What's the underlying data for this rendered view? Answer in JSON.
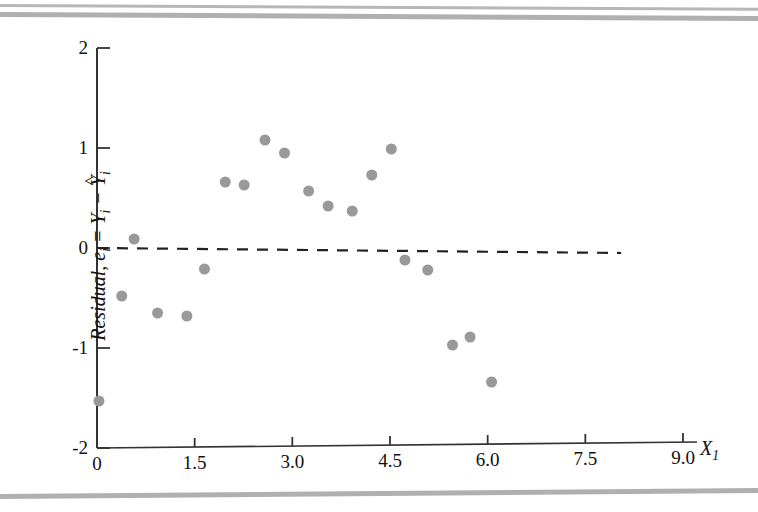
{
  "chart_data": {
    "type": "scatter",
    "title": "",
    "xlabel": "X1",
    "ylabel": "Residual, e_i = Y_i - Y-hat_i",
    "xlim": [
      0,
      9.0
    ],
    "ylim": [
      -2,
      2
    ],
    "xticks": [
      "0",
      "1.5",
      "3.0",
      "4.5",
      "6.0",
      "7.5",
      "9.0"
    ],
    "xtick_values": [
      0,
      1.5,
      3.0,
      4.5,
      6.0,
      7.5,
      9.0
    ],
    "yticks": [
      "2",
      "1",
      "0",
      "-1",
      "-2"
    ],
    "ytick_values": [
      2,
      1,
      0,
      -1,
      -2
    ],
    "grid": false,
    "legend": "none",
    "marker": {
      "shape": "circle",
      "color": "#999999",
      "size": 11
    },
    "reference_line": {
      "label": "zero residual line",
      "style": "dashed",
      "color": "#222222",
      "x_start": 0.0,
      "x_end": 8.05,
      "y_start": 0.0,
      "y_end": -0.05
    },
    "points": [
      {
        "x": 0.03,
        "y": -1.53
      },
      {
        "x": 0.38,
        "y": -0.48
      },
      {
        "x": 0.57,
        "y": 0.09
      },
      {
        "x": 0.93,
        "y": -0.65
      },
      {
        "x": 1.38,
        "y": -0.68
      },
      {
        "x": 1.65,
        "y": -0.21
      },
      {
        "x": 1.97,
        "y": 0.66
      },
      {
        "x": 2.26,
        "y": 0.63
      },
      {
        "x": 2.58,
        "y": 1.08
      },
      {
        "x": 2.88,
        "y": 0.95
      },
      {
        "x": 3.25,
        "y": 0.57
      },
      {
        "x": 3.55,
        "y": 0.42
      },
      {
        "x": 3.92,
        "y": 0.37
      },
      {
        "x": 4.22,
        "y": 0.73
      },
      {
        "x": 4.52,
        "y": 0.99
      },
      {
        "x": 4.73,
        "y": -0.12
      },
      {
        "x": 5.08,
        "y": -0.22
      },
      {
        "x": 5.46,
        "y": -0.97
      },
      {
        "x": 5.73,
        "y": -0.89
      },
      {
        "x": 6.06,
        "y": -1.34
      }
    ]
  },
  "axes": {
    "x_axis_label": "X",
    "x_axis_subscript": "1",
    "y_axis_label_prefix": "Residual, e",
    "y_axis_label_sub1": "i",
    "y_axis_label_mid": " = Y",
    "y_axis_label_sub2": "i",
    "y_axis_label_minus": " − ",
    "y_axis_label_yhat": "Y",
    "y_axis_label_hat": "^",
    "y_axis_label_sub3": "i"
  }
}
